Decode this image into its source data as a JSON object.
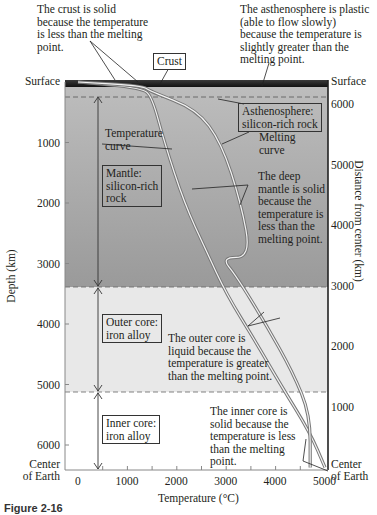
{
  "annotations": {
    "crust_solid": "The crust is solid\nbecause the temperature\nis less than the melting\npoint.",
    "asthenosphere_plastic": "The asthenosphere is plastic\n(able to flow slowly)\nbecause the temperature is\nslightly greater than the\nmelting point.",
    "crust_label": "Crust",
    "asthenosphere_label": "Asthenosphere:\nsilicon-rich rock",
    "temperature_curve_label": "Temperature\ncurve",
    "melting_curve_label": "Melting\ncurve",
    "mantle_label": "Mantle:\nsilicon-rich\nrock",
    "deep_mantle_solid": "The deep\nmantle is solid\nbecause the\ntemperature is\nless than the\nmelting point.",
    "outer_core_label": "Outer core:\niron alloy",
    "outer_core_liquid": "The outer core is\nliquid because the\ntemperature is greater\nthan the melting point.",
    "inner_core_label": "Inner core:\niron alloy",
    "inner_core_solid": "The inner core is\nsolid because the\ntemperature is less\nthan the melting\npoint."
  },
  "caption": "Figure 2-16",
  "colors": {
    "crust": "#1a1a1a",
    "mantle": "#a7a7a7",
    "outer_core": "#e6e6e6",
    "inner_core": "#ffffff",
    "curve": "#777777"
  },
  "chart_data": {
    "type": "line",
    "title": "",
    "xlabel": "Temperature (°C)",
    "ylabel": "Depth (km)",
    "y2label": "Distance from center (km)",
    "xlim": [
      0,
      5000
    ],
    "ylim": [
      0,
      6371
    ],
    "x_ticks": [
      "0",
      "1000",
      "2000",
      "3000",
      "4000",
      "5000"
    ],
    "y_ticks": [
      "Surface",
      "1000",
      "2000",
      "3000",
      "4000",
      "5000",
      "6000",
      "Center\nof Earth"
    ],
    "y2_ticks": [
      "Surface",
      "6000",
      "5000",
      "4000",
      "3000",
      "2000",
      "1000",
      "Center\nof Earth"
    ],
    "layers": [
      {
        "name": "Crust",
        "depth_from": 0,
        "depth_to": 35
      },
      {
        "name": "Asthenosphere",
        "depth_from": 35,
        "depth_to": 250
      },
      {
        "name": "Mantle",
        "depth_from": 250,
        "depth_to": 2900
      },
      {
        "name": "Outer core",
        "depth_from": 2900,
        "depth_to": 5150
      },
      {
        "name": "Inner core",
        "depth_from": 5150,
        "depth_to": 6371
      }
    ],
    "series": [
      {
        "name": "Temperature curve",
        "points": [
          [
            0,
            0
          ],
          [
            1300,
            100
          ],
          [
            1500,
            250
          ],
          [
            1750,
            1000
          ],
          [
            2150,
            2000
          ],
          [
            2600,
            2800
          ],
          [
            3000,
            3500
          ],
          [
            3600,
            4300
          ],
          [
            4100,
            5000
          ],
          [
            4700,
            5800
          ],
          [
            5000,
            6371
          ]
        ]
      },
      {
        "name": "Melting curve",
        "points": [
          [
            0,
            0
          ],
          [
            1300,
            60
          ],
          [
            1450,
            150
          ],
          [
            2400,
            450
          ],
          [
            2900,
            1000
          ],
          [
            3300,
            2000
          ],
          [
            3500,
            2900
          ],
          [
            2900,
            2900
          ],
          [
            3200,
            3200
          ],
          [
            3800,
            4000
          ],
          [
            4350,
            4800
          ],
          [
            4700,
            5500
          ],
          [
            4700,
            6371
          ]
        ]
      }
    ]
  }
}
